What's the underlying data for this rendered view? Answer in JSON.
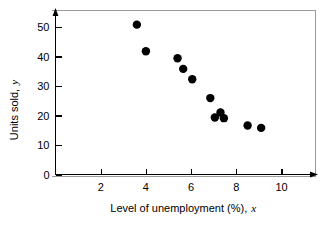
{
  "chart_data": {
    "type": "scatter",
    "title": "",
    "xlabel": "Level of unemployment (%), x",
    "xlabel_main": "Level of unemployment (%),",
    "xlabel_var": "x",
    "ylabel": "Units sold, y",
    "ylabel_main": "Units sold,",
    "ylabel_var": "y",
    "xlim": [
      0,
      11.4
    ],
    "ylim": [
      0,
      54
    ],
    "xticks": [
      2,
      4,
      6,
      8,
      10
    ],
    "xtick_labels": [
      "2",
      "4",
      "6",
      "8",
      "10"
    ],
    "yticks": [
      0,
      10,
      20,
      30,
      40,
      50
    ],
    "ytick_labels": [
      "0",
      "10",
      "20",
      "30",
      "40",
      "50"
    ],
    "grid": false,
    "legend": null,
    "marker": "filled-circle",
    "marker_color": "#000000",
    "marker_size": 4.6,
    "n_points": 11,
    "x": [
      3.6,
      4.0,
      5.4,
      5.65,
      6.05,
      6.85,
      7.05,
      7.3,
      7.45,
      8.5,
      9.1
    ],
    "y": [
      50.8,
      41.8,
      39.4,
      35.8,
      32.3,
      25.9,
      19.3,
      21.0,
      19.1,
      16.6,
      15.8
    ],
    "points": [
      {
        "x": 3.6,
        "y": 50.8
      },
      {
        "x": 4.0,
        "y": 41.8
      },
      {
        "x": 5.4,
        "y": 39.4
      },
      {
        "x": 5.65,
        "y": 35.8
      },
      {
        "x": 6.05,
        "y": 32.3
      },
      {
        "x": 6.85,
        "y": 25.9
      },
      {
        "x": 7.05,
        "y": 19.3
      },
      {
        "x": 7.3,
        "y": 21.0
      },
      {
        "x": 7.45,
        "y": 19.1
      },
      {
        "x": 8.5,
        "y": 16.6
      },
      {
        "x": 9.1,
        "y": 15.8
      }
    ]
  }
}
